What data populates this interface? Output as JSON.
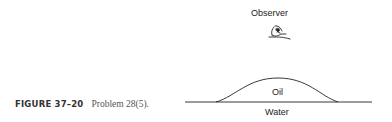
{
  "figure": {
    "labels": {
      "observer": "Observer",
      "oil": "Oil",
      "water": "Water"
    },
    "icons": {
      "observer": "eye-icon"
    },
    "caption": {
      "figure_number": "FIGURE 37–20",
      "text": "Problem 28(5)."
    }
  }
}
